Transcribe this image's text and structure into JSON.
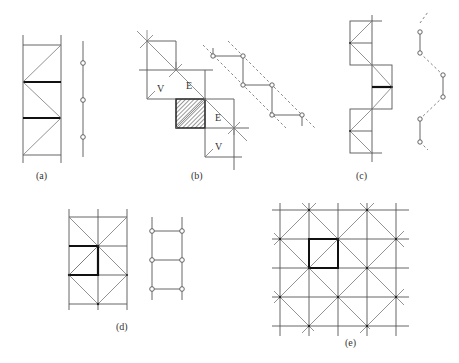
{
  "figure": {
    "panels": [
      {
        "id": "a",
        "label": "(a)",
        "description": "Vertical strip of squares with zigzag diagonals, thick horizontal edges, and a vertical chain of nodes"
      },
      {
        "id": "b",
        "label": "(b)",
        "description": "Diagonal staircase of squares with a hatched square, labels V and E, and a zigzag node chain between dashed lines",
        "labels": [
          "V",
          "E",
          "E",
          "V"
        ]
      },
      {
        "id": "c",
        "label": "(c)",
        "description": "Offset squares with diagonals forming a zigzag, one thick edge, and a wavy node chain with dashed links"
      },
      {
        "id": "d",
        "label": "(d)",
        "description": "Rectangular grid with diamond diagonals, thick L-shaped edges, and a ladder of nodes"
      },
      {
        "id": "e",
        "label": "(e)",
        "description": "Square lattice with diagonal lines crossing at alternate vertices, one thick highlighted square"
      }
    ]
  }
}
